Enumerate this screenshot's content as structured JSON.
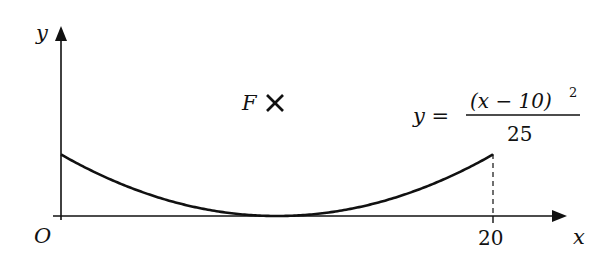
{
  "chart_data": {
    "type": "line",
    "title": "",
    "xlabel": "x",
    "ylabel": "y",
    "origin_label": "O",
    "x_ticks": [
      {
        "value": 20,
        "label": "20"
      }
    ],
    "xlim": [
      0,
      20
    ],
    "ylim": [
      0,
      4
    ],
    "grid": false,
    "series": [
      {
        "name": "y = (x - 10)^2 / 25",
        "equation": "y = (x − 10)² / 25",
        "x": [
          0,
          2,
          4,
          6,
          8,
          10,
          12,
          14,
          16,
          18,
          20
        ],
        "y": [
          4,
          2.56,
          1.44,
          0.64,
          0.16,
          0,
          0.16,
          0.64,
          1.44,
          2.56,
          4
        ]
      }
    ],
    "annotations": [
      {
        "type": "point-marker",
        "label": "F",
        "marker": "cross"
      },
      {
        "type": "dashed-vertical",
        "x": 20,
        "from_y": 0,
        "to_y": 4
      }
    ]
  },
  "labels": {
    "y_axis": "y",
    "x_axis": "x",
    "origin": "O",
    "tick_20": "20",
    "focus": "F",
    "focus_marker": "✕",
    "eq_lhs": "y =",
    "eq_numerator_base": "(x − 10)",
    "eq_numerator_exp": "2",
    "eq_denominator": "25"
  }
}
